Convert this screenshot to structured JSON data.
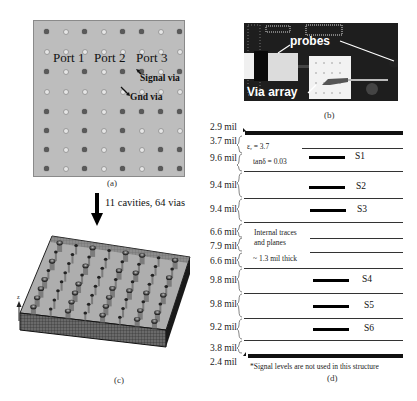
{
  "figure": {
    "panels": {
      "a": {
        "caption": "(a)",
        "ports": [
          "Port 1",
          "Port 2",
          "Port 3"
        ],
        "annotations": {
          "signal_via": "Signal via",
          "gnd_via": "Gnd via"
        },
        "grid_size": [
          8,
          8
        ],
        "via_pattern": [
          "SGSGSSGS",
          "GGGGGGGG",
          "SGSGSSGS",
          "GGGGGGGG",
          "SGSGSSSS",
          "SGSGSGGG",
          "SGSGSGSS",
          "SGSGSGSS"
        ],
        "colors": {
          "board": "#bdbdbd",
          "signal_via": "#5a5a5a",
          "gnd_via": "#e6e6e6"
        }
      },
      "transition": {
        "text": "11 cavities, 64 vias"
      },
      "b": {
        "caption": "(b)",
        "labels": {
          "probes": "probes",
          "via_array": "Via array"
        }
      },
      "c": {
        "caption": "(c)",
        "axis_label": "z"
      },
      "d": {
        "caption": "(d)",
        "layer_thicknesses": [
          "2.9 mil",
          "3.7 mil",
          "9.6 mil",
          "9.4 mil",
          "9.4 mil",
          "6.6 mil",
          "7.9 mil",
          "6.6 mil",
          "9.8 mil",
          "9.8 mil",
          "9.2 mil",
          "3.8 mil",
          "2.4 mil"
        ],
        "material": {
          "er": "εᵣ = 3.7",
          "tand": "tanδ = 0.03"
        },
        "internal_note": [
          "Internal traces",
          "and planes",
          "~ 1.3 mil thick"
        ],
        "signal_labels": [
          "S1",
          "S2",
          "S3",
          "S4",
          "S5",
          "S6"
        ],
        "footnote": "*Signal levels are not used in this structure"
      }
    }
  }
}
